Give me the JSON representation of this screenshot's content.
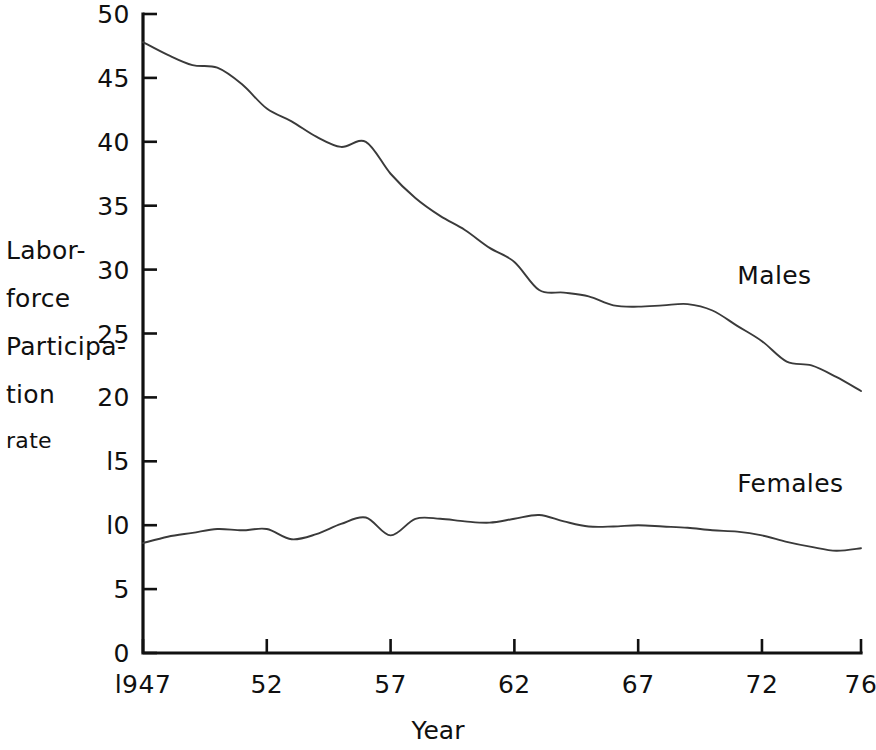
{
  "chart_data": {
    "type": "line",
    "title": "",
    "xlabel": "Year",
    "ylabel": "Labor-force Participation rate",
    "ylabel_lines": [
      "Labor-",
      "force",
      "Participa-",
      "tion",
      "rate"
    ],
    "xlim": [
      1947,
      1976
    ],
    "ylim": [
      0,
      50
    ],
    "grid": false,
    "legend_position": "inline-right",
    "y_ticks": [
      0,
      5,
      10,
      15,
      20,
      25,
      30,
      35,
      40,
      45,
      50
    ],
    "y_tick_labels": [
      "0",
      "5",
      "l0",
      "l5",
      "20",
      "25",
      "30",
      "35",
      "40",
      "45",
      "50"
    ],
    "x_ticks": [
      1947,
      1952,
      1957,
      1962,
      1967,
      1972,
      1976
    ],
    "x_tick_labels": [
      "l947",
      "52",
      "57",
      "62",
      "67",
      "72",
      "76"
    ],
    "x": [
      1947,
      1948,
      1949,
      1950,
      1951,
      1952,
      1953,
      1954,
      1955,
      1956,
      1957,
      1958,
      1959,
      1960,
      1961,
      1962,
      1963,
      1964,
      1965,
      1966,
      1967,
      1968,
      1969,
      1970,
      1971,
      1972,
      1973,
      1974,
      1975,
      1976
    ],
    "series": [
      {
        "name": "Males",
        "values": [
          47.8,
          46.8,
          46.0,
          45.8,
          44.5,
          42.6,
          41.6,
          40.4,
          39.6,
          40.0,
          37.5,
          35.6,
          34.2,
          33.1,
          31.7,
          30.6,
          28.4,
          28.2,
          27.9,
          27.2,
          27.1,
          27.2,
          27.3,
          26.8,
          25.6,
          24.4,
          22.8,
          22.5,
          21.6,
          20.5
        ]
      },
      {
        "name": "Females",
        "values": [
          8.6,
          9.1,
          9.4,
          9.7,
          9.6,
          9.7,
          8.9,
          9.3,
          10.1,
          10.6,
          9.2,
          10.5,
          10.5,
          10.3,
          10.2,
          10.5,
          10.8,
          10.3,
          9.9,
          9.9,
          10.0,
          9.9,
          9.8,
          9.6,
          9.5,
          9.2,
          8.7,
          8.3,
          8.0,
          8.2
        ]
      }
    ],
    "series_labels": [
      {
        "text": "Males",
        "x": 1971,
        "y": 29.5
      },
      {
        "text": "Females",
        "x": 1971,
        "y": 13.2
      }
    ]
  },
  "colors": {
    "background": "#ffffff",
    "axis": "#111111",
    "line": "#3a3a3a",
    "text": "#101010"
  }
}
